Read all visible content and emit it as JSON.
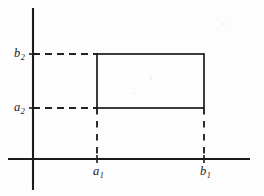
{
  "figure": {
    "kind": "coordinate-diagram",
    "background_color": "#fdfdfd",
    "ink_color": "#1b1b1b"
  },
  "labels": {
    "y_upper": {
      "base": "b",
      "sub": "2"
    },
    "y_lower": {
      "base": "a",
      "sub": "2"
    },
    "x_left": {
      "base": "a",
      "sub": "1"
    },
    "x_right": {
      "base": "b",
      "sub": "1"
    }
  },
  "geometry": {
    "origin": {
      "x": 33,
      "y": 159
    },
    "y_axis": {
      "x": 33,
      "y_top": 8,
      "y_bottom": 190
    },
    "x_axis": {
      "y": 159,
      "x_left": 8,
      "x_right": 250
    },
    "rectangle": {
      "left": 97,
      "right": 204,
      "top": 54,
      "bottom": 108
    },
    "dashed_horizontal": [
      {
        "label": "b2",
        "from_x": 33,
        "to_x": 97,
        "y": 54
      },
      {
        "label": "a2",
        "from_x": 33,
        "to_x": 97,
        "y": 108
      }
    ],
    "dashed_vertical": [
      {
        "label": "a1",
        "x": 97,
        "from_y": 108,
        "to_y": 159
      },
      {
        "label": "b1",
        "x": 204,
        "from_y": 108,
        "to_y": 159
      }
    ]
  }
}
